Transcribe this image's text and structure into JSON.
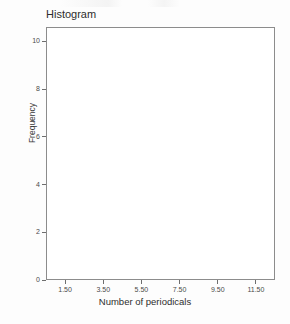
{
  "chart_data": {
    "type": "bar",
    "title": "Histogram",
    "xlabel": "Number of periodicals",
    "ylabel": "Frequency",
    "categories": [],
    "values": [],
    "series": [],
    "x_ticks": [
      "1.50",
      "3.50",
      "5.50",
      "7.50",
      "9.50",
      "11.50"
    ],
    "x_tick_values": [
      1.5,
      3.5,
      5.5,
      7.5,
      9.5,
      11.5
    ],
    "y_ticks": [
      "0",
      "2",
      "4",
      "6",
      "8",
      "10"
    ],
    "y_tick_values": [
      0,
      2,
      4,
      6,
      8,
      10
    ],
    "xlim": [
      0.5,
      12.5
    ],
    "ylim": [
      0,
      10.6
    ],
    "grid": false,
    "legend": null
  }
}
